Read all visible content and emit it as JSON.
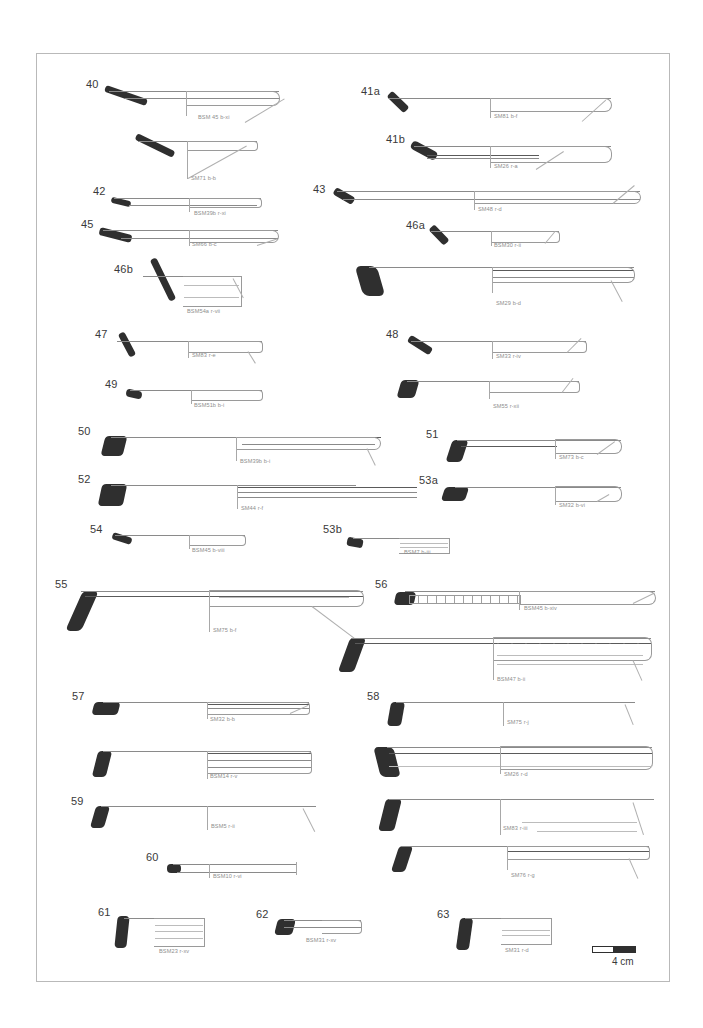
{
  "plate": {
    "title": "Pottery profile plate",
    "background_color": "#ffffff",
    "frame_color": "#b9b9b9",
    "ink_color": "#2f2f2f",
    "outline_color": "#8a8a8a",
    "code_color": "#8e8e8e"
  },
  "scale": {
    "label": "4 cm",
    "segments": [
      "white",
      "black"
    ]
  },
  "figures": [
    {
      "id": "40",
      "number": "40",
      "code": "BSM 45 b-xi",
      "x": 85,
      "y": 78,
      "w": 200,
      "h": 42,
      "type": "bowl-flared",
      "num_x": 85,
      "num_y": 78,
      "code_x": 196,
      "code_y": 114
    },
    {
      "id": "40b",
      "number": "",
      "code": "SM71 b-b",
      "x": 130,
      "y": 130,
      "w": 125,
      "h": 50,
      "type": "bowl-deep",
      "num_x": 0,
      "num_y": 0,
      "code_x": 190,
      "code_y": 172
    },
    {
      "id": "42",
      "number": "42",
      "code": "BSM39b r-xi",
      "x": 92,
      "y": 185,
      "w": 160,
      "h": 30,
      "type": "bowl-shallow",
      "num_x": 92,
      "num_y": 185,
      "code_x": 192,
      "code_y": 210
    },
    {
      "id": "45",
      "number": "45",
      "code": "SM66 b-c",
      "x": 80,
      "y": 218,
      "w": 205,
      "h": 32,
      "type": "bowl-flared",
      "num_x": 80,
      "num_y": 218,
      "code_x": 190,
      "code_y": 241
    },
    {
      "id": "46b",
      "number": "46b",
      "code": "BSM54a r-vii",
      "x": 113,
      "y": 263,
      "w": 130,
      "h": 48,
      "type": "bowl-deep",
      "num_x": 113,
      "num_y": 263,
      "code_x": 186,
      "code_y": 310
    },
    {
      "id": "47",
      "number": "47",
      "code": "SM83 r-e",
      "x": 94,
      "y": 328,
      "w": 165,
      "h": 33,
      "type": "bowl-flared",
      "num_x": 94,
      "num_y": 328,
      "code_x": 193,
      "code_y": 352
    },
    {
      "id": "49",
      "number": "49",
      "code": "BSM51b b-i",
      "x": 105,
      "y": 378,
      "w": 155,
      "h": 28,
      "type": "bowl-shallow",
      "num_x": 105,
      "num_y": 378,
      "code_x": 193,
      "code_y": 402
    },
    {
      "id": "50",
      "number": "50",
      "code": "BSM39b b-i",
      "x": 78,
      "y": 425,
      "w": 300,
      "h": 38,
      "type": "platter",
      "num_x": 78,
      "num_y": 425,
      "code_x": 248,
      "code_y": 459
    },
    {
      "id": "52",
      "number": "52",
      "code": "SM44 r-f",
      "x": 78,
      "y": 473,
      "w": 300,
      "h": 38,
      "type": "platter",
      "num_x": 78,
      "num_y": 473,
      "code_x": 258,
      "code_y": 505
    },
    {
      "id": "54",
      "number": "54",
      "code": "BSM45 b-viii",
      "x": 90,
      "y": 523,
      "w": 155,
      "h": 26,
      "type": "bowl-shallow",
      "num_x": 90,
      "num_y": 523,
      "code_x": 192,
      "code_y": 546
    },
    {
      "id": "55",
      "number": "55",
      "code": "SM75 b-f",
      "x": 55,
      "y": 578,
      "w": 300,
      "h": 48,
      "type": "platter-long",
      "num_x": 55,
      "num_y": 578,
      "code_x": 218,
      "code_y": 627
    },
    {
      "id": "57",
      "number": "57",
      "code": "SM32 b-b",
      "x": 90,
      "y": 690,
      "w": 220,
      "h": 32,
      "type": "platter",
      "num_x": 90,
      "num_y": 690,
      "code_x": 218,
      "code_y": 717
    },
    {
      "id": "57b",
      "number": "",
      "code": "BSM14 r-v",
      "x": 92,
      "y": 742,
      "w": 220,
      "h": 38,
      "type": "platter",
      "num_x": 0,
      "num_y": 0,
      "code_x": 218,
      "code_y": 773
    },
    {
      "id": "59",
      "number": "59",
      "code": "BSM5 r-ii",
      "x": 90,
      "y": 795,
      "w": 225,
      "h": 34,
      "type": "bowl-flared",
      "num_x": 90,
      "num_y": 795,
      "code_x": 220,
      "code_y": 824
    },
    {
      "id": "60",
      "number": "60",
      "code": "BSM10 r-vi",
      "x": 148,
      "y": 852,
      "w": 130,
      "h": 24,
      "type": "bowl-shallow",
      "num_x": 148,
      "num_y": 852,
      "code_x": 218,
      "code_y": 871
    },
    {
      "id": "61",
      "number": "61",
      "code": "BSM23 r-xv",
      "x": 100,
      "y": 906,
      "w": 110,
      "h": 36,
      "type": "ribbed",
      "num_x": 100,
      "num_y": 906,
      "code_x": 158,
      "code_y": 941
    },
    {
      "id": "62",
      "number": "62",
      "code": "BSM31 r-xv",
      "x": 258,
      "y": 908,
      "w": 100,
      "h": 30,
      "type": "ribbed",
      "num_x": 258,
      "num_y": 908,
      "code_x": 305,
      "code_y": 937
    },
    {
      "id": "41a",
      "number": "41a",
      "code": "SM81 b-f",
      "x": 360,
      "y": 85,
      "w": 215,
      "h": 34,
      "type": "platter",
      "num_x": 360,
      "num_y": 85,
      "code_x": 497,
      "code_y": 113
    },
    {
      "id": "41b",
      "number": "41b",
      "code": "SM26 r-a",
      "x": 385,
      "y": 133,
      "w": 190,
      "h": 36,
      "type": "platter",
      "num_x": 385,
      "num_y": 133,
      "code_x": 500,
      "code_y": 164
    },
    {
      "id": "43",
      "number": "43",
      "code": "SM48 r-d",
      "x": 316,
      "y": 182,
      "w": 295,
      "h": 30,
      "type": "platter-long",
      "num_x": 316,
      "num_y": 182,
      "code_x": 474,
      "code_y": 206
    },
    {
      "id": "46a",
      "number": "46a",
      "code": "BSM30 r-ii",
      "x": 405,
      "y": 219,
      "w": 125,
      "h": 28,
      "type": "bowl-shallow",
      "num_x": 405,
      "num_y": 219,
      "code_x": 492,
      "code_y": 242
    },
    {
      "id": "46c",
      "number": "",
      "code": "SM29 b-d",
      "x": 358,
      "y": 265,
      "w": 275,
      "h": 38,
      "type": "platter",
      "num_x": 0,
      "num_y": 0,
      "code_x": 495,
      "code_y": 300
    },
    {
      "id": "48",
      "number": "48",
      "code": "SM33 r-iv",
      "x": 385,
      "y": 328,
      "w": 200,
      "h": 32,
      "type": "bowl-flared",
      "num_x": 385,
      "num_y": 328,
      "code_x": 498,
      "code_y": 353
    },
    {
      "id": "48b",
      "number": "",
      "code": "SM55 r-xii",
      "x": 398,
      "y": 378,
      "w": 190,
      "h": 32,
      "type": "bowl-flared",
      "num_x": 0,
      "num_y": 0,
      "code_x": 494,
      "code_y": 403
    },
    {
      "id": "51",
      "number": "51",
      "code": "SM73 b-c",
      "x": 425,
      "y": 428,
      "w": 195,
      "h": 34,
      "type": "platter",
      "num_x": 425,
      "num_y": 428,
      "code_x": 533,
      "code_y": 455
    },
    {
      "id": "53a",
      "number": "53a",
      "code": "SM32 b-vi",
      "x": 418,
      "y": 474,
      "w": 195,
      "h": 34,
      "type": "platter",
      "num_x": 418,
      "num_y": 474,
      "code_x": 533,
      "code_y": 503
    },
    {
      "id": "53b",
      "number": "53b",
      "code": "BSM7 b-iii",
      "x": 322,
      "y": 523,
      "w": 125,
      "h": 30,
      "type": "ribbed",
      "num_x": 322,
      "num_y": 523,
      "code_x": 403,
      "code_y": 549
    },
    {
      "id": "56",
      "number": "56",
      "code": "BSM45 b-xiv",
      "x": 374,
      "y": 578,
      "w": 280,
      "h": 34,
      "type": "notched",
      "num_x": 374,
      "num_y": 578,
      "code_x": 525,
      "code_y": 606
    },
    {
      "id": "56b",
      "number": "",
      "code": "BSM47 b-ii",
      "x": 340,
      "y": 635,
      "w": 310,
      "h": 48,
      "type": "notched",
      "num_x": 0,
      "num_y": 0,
      "code_x": 503,
      "code_y": 679
    },
    {
      "id": "58",
      "number": "58",
      "code": "SM75 r-j",
      "x": 366,
      "y": 690,
      "w": 230,
      "h": 38,
      "type": "bowl-flared",
      "num_x": 366,
      "num_y": 690,
      "code_x": 508,
      "code_y": 721
    },
    {
      "id": "58b",
      "number": "",
      "code": "SM26 r-d",
      "x": 370,
      "y": 742,
      "w": 265,
      "h": 38,
      "type": "platter",
      "num_x": 0,
      "num_y": 0,
      "code_x": 505,
      "code_y": 775
    },
    {
      "id": "58c",
      "number": "",
      "code": "SM83 r-iii",
      "x": 378,
      "y": 795,
      "w": 260,
      "h": 42,
      "type": "bowl-deep",
      "num_x": 0,
      "num_y": 0,
      "code_x": 502,
      "code_y": 830
    },
    {
      "id": "58d",
      "number": "",
      "code": "SM76 r-g",
      "x": 392,
      "y": 845,
      "w": 250,
      "h": 38,
      "type": "bowl-flared",
      "num_x": 0,
      "num_y": 0,
      "code_x": 508,
      "code_y": 880
    },
    {
      "id": "63",
      "number": "63",
      "code": "SM31 r-d",
      "x": 438,
      "y": 908,
      "w": 115,
      "h": 38,
      "type": "ribbed",
      "num_x": 438,
      "num_y": 908,
      "code_x": 500,
      "code_y": 950
    }
  ]
}
